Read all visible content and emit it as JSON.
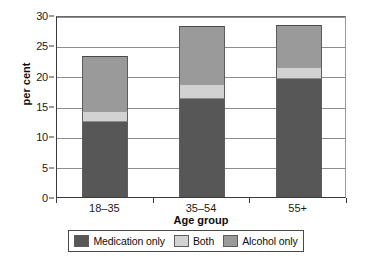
{
  "chart_data": {
    "type": "bar",
    "subtype": "stacked-bar",
    "title": "",
    "xlabel": "Age group",
    "ylabel": "per cent",
    "categories": [
      "18–35",
      "35–54",
      "55+"
    ],
    "series": [
      {
        "name": "Medication only",
        "values": [
          12.4,
          16.1,
          19.4
        ],
        "color": "#575757"
      },
      {
        "name": "Both",
        "values": [
          1.8,
          2.5,
          2.0
        ],
        "color": "#d2d2d2"
      },
      {
        "name": "Alcohol only",
        "values": [
          9.0,
          9.6,
          7.0
        ],
        "color": "#9a9a9a"
      }
    ],
    "totals": [
      23.2,
      28.2,
      28.4
    ],
    "ylim": [
      0,
      30
    ],
    "yticks": [
      0,
      5,
      10,
      15,
      20,
      25,
      30
    ],
    "ytick_labels": [
      "0",
      "5",
      "10",
      "15",
      "20",
      "25",
      "30"
    ],
    "grid": true,
    "grid_axis": "y",
    "legend_position": "bottom"
  },
  "axes": {
    "y_title": "per cent",
    "x_title": "Age group"
  },
  "legend": {
    "entries": [
      {
        "label": "Medication only",
        "swatch_color": "#575757"
      },
      {
        "label": "Both",
        "swatch_color": "#d2d2d2"
      },
      {
        "label": "Alcohol only",
        "swatch_color": "#9a9a9a"
      }
    ]
  }
}
